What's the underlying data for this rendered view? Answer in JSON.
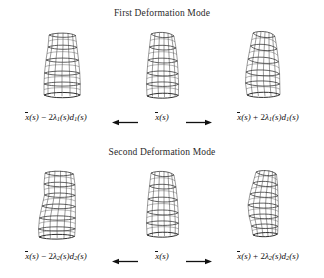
{
  "figure": {
    "background_color": "#ffffff",
    "line_color": "#3a3a3a",
    "panels": [
      {
        "id": "first-deformation-mode",
        "title": "First Deformation Mode",
        "items": [
          {
            "position": "left",
            "shape_name": "barrel-wireframe-minus-mode-1",
            "equation": {
              "mean": "x",
              "operator": "−",
              "coefficient": "2",
              "lambda": "λ",
              "subscript": "1",
              "direction": "d",
              "argument": "(s)",
              "plain": "x̄(s) − 2λ₁(s)d₁(s)"
            }
          },
          {
            "position": "center",
            "shape_name": "barrel-wireframe-mean-1",
            "equation": {
              "mean": "x",
              "argument": "(s)",
              "plain": "x̄(s)"
            }
          },
          {
            "position": "right",
            "shape_name": "barrel-wireframe-plus-mode-1",
            "equation": {
              "mean": "x",
              "operator": "+",
              "coefficient": "2",
              "lambda": "λ",
              "subscript": "1",
              "direction": "d",
              "argument": "(s)",
              "plain": "x̄(s) + 2λ₁(s)d₁(s)"
            }
          }
        ],
        "arrows": [
          {
            "name": "arrow-to-minus",
            "direction": "left"
          },
          {
            "name": "arrow-to-plus",
            "direction": "right"
          }
        ]
      },
      {
        "id": "second-deformation-mode",
        "title": "Second Deformation Mode",
        "items": [
          {
            "position": "left",
            "shape_name": "barrel-wireframe-minus-mode-2",
            "equation": {
              "mean": "x",
              "operator": "−",
              "coefficient": "2",
              "lambda": "λ",
              "subscript": "2",
              "direction": "d",
              "argument": "(s)",
              "plain": "x̄(s) − 2λ₂(s)d₂(s)"
            }
          },
          {
            "position": "center",
            "shape_name": "barrel-wireframe-mean-2",
            "equation": {
              "mean": "x",
              "argument": "(s)",
              "plain": "x̄(s)"
            }
          },
          {
            "position": "right",
            "shape_name": "barrel-wireframe-plus-mode-2",
            "equation": {
              "mean": "x",
              "operator": "+",
              "coefficient": "2",
              "lambda": "λ",
              "subscript": "2",
              "direction": "d",
              "argument": "(s)",
              "plain": "x̄(s) + 2λ₂(s)d₂(s)"
            }
          }
        ],
        "arrows": [
          {
            "name": "arrow-to-minus",
            "direction": "left"
          },
          {
            "name": "arrow-to-plus",
            "direction": "right"
          }
        ]
      }
    ]
  }
}
